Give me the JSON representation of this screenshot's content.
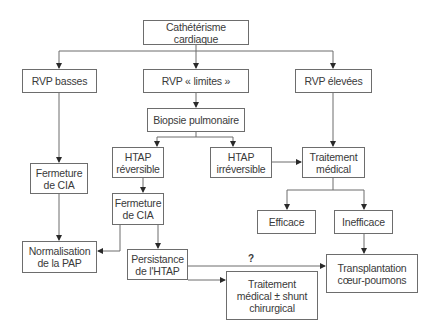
{
  "diagram": {
    "nodes": {
      "cath": "Cathétérisme cardiaque",
      "rvp_basses": "RVP basses",
      "rvp_limites": "RVP « limites »",
      "rvp_elevees": "RVP élevées",
      "biopsie": "Biopsie pulmonaire",
      "htap_rev": "HTAP\nréversible",
      "htap_irrev": "HTAP\nirréversible",
      "traitement_medical": "Traitement\nmédical",
      "fermeture_cia_left": "Fermeture\nde CIA",
      "fermeture_cia_center": "Fermeture\nde CIA",
      "efficace": "Efficace",
      "inefficace": "Inefficace",
      "normalisation": "Normalisation\nde la PAP",
      "persistance": "Persistance\nde l'HTAP",
      "traitement_shunt": "Traitement\nmédical ± shunt\nchirurgical",
      "transplantation": "Transplantation\ncœur-poumons"
    },
    "edge_labels": {
      "uncertain": "?"
    },
    "edges": [
      [
        "cath",
        "rvp_basses"
      ],
      [
        "cath",
        "rvp_limites"
      ],
      [
        "cath",
        "rvp_elevees"
      ],
      [
        "rvp_basses",
        "fermeture_cia_left"
      ],
      [
        "fermeture_cia_left",
        "normalisation"
      ],
      [
        "rvp_limites",
        "biopsie"
      ],
      [
        "biopsie",
        "htap_rev"
      ],
      [
        "biopsie",
        "htap_irrev"
      ],
      [
        "htap_irrev",
        "traitement_medical"
      ],
      [
        "rvp_elevees",
        "traitement_medical"
      ],
      [
        "htap_rev",
        "fermeture_cia_center"
      ],
      [
        "fermeture_cia_center",
        "normalisation"
      ],
      [
        "fermeture_cia_center",
        "persistance"
      ],
      [
        "persistance",
        "transplantation"
      ],
      [
        "persistance",
        "traitement_shunt"
      ],
      [
        "traitement_medical",
        "efficace"
      ],
      [
        "traitement_medical",
        "inefficace"
      ],
      [
        "inefficace",
        "transplantation"
      ]
    ]
  }
}
